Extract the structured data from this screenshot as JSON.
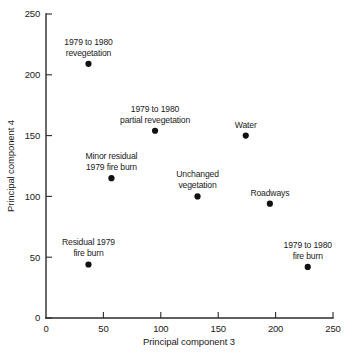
{
  "chart_data": {
    "type": "scatter",
    "title": "",
    "subtitle": "",
    "xlabel": "Principal component 3",
    "ylabel": "Principal component 4",
    "xlim": [
      0,
      250
    ],
    "ylim": [
      0,
      250
    ],
    "xticks": [
      "0",
      "50",
      "100",
      "150",
      "200",
      "250"
    ],
    "yticks": [
      "0",
      "50",
      "100",
      "150",
      "200",
      "250"
    ],
    "xtick_values": [
      0,
      50,
      100,
      150,
      200,
      250
    ],
    "ytick_values": [
      0,
      50,
      100,
      150,
      200,
      250
    ],
    "grid": false,
    "legend": "none",
    "points": [
      {
        "x": 37,
        "y": 209,
        "label": "1979 to 1980\nrevegetation",
        "label_lines": [
          "1979 to 1980",
          "revegetation"
        ],
        "label_position": "above",
        "label_align": "middle"
      },
      {
        "x": 95,
        "y": 154,
        "label": "1979 to 1980\npartial revegetation",
        "label_lines": [
          "1979 to 1980",
          "partial revegetation"
        ],
        "label_position": "above",
        "label_align": "middle"
      },
      {
        "x": 57,
        "y": 115,
        "label": "Minor residual\n1979 fire burn",
        "label_lines": [
          "Minor residual",
          "1979 fire burn"
        ],
        "label_position": "above",
        "label_align": "middle"
      },
      {
        "x": 132,
        "y": 100,
        "label": "Unchanged\nvegetation",
        "label_lines": [
          "Unchanged",
          "vegetation"
        ],
        "label_position": "above",
        "label_align": "middle"
      },
      {
        "x": 174,
        "y": 150,
        "label": "Water",
        "label_lines": [
          "Water"
        ],
        "label_position": "above",
        "label_align": "middle"
      },
      {
        "x": 195,
        "y": 94,
        "label": "Roadways",
        "label_lines": [
          "Roadways"
        ],
        "label_position": "above",
        "label_align": "middle"
      },
      {
        "x": 37,
        "y": 44,
        "label": "Residual 1979\nfire burn",
        "label_lines": [
          "Residual 1979",
          "fire burn"
        ],
        "label_position": "above",
        "label_align": "middle"
      },
      {
        "x": 228,
        "y": 42,
        "label": "1979 to 1980\nfire burn",
        "label_lines": [
          "1979 to 1980",
          "fire burn"
        ],
        "label_position": "above",
        "label_align": "middle"
      }
    ],
    "colors": {
      "marker": "#111111",
      "axis": "#2b2b2b",
      "text": "#1a1a1a",
      "background": "#ffffff"
    }
  }
}
